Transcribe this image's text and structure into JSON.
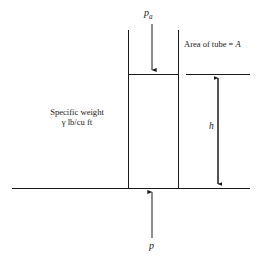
{
  "figure": {
    "background_color": "#ffffff",
    "line_color": "#1a1a1a",
    "width": 276,
    "height": 262
  },
  "labels": {
    "applied_pressure": {
      "symbol": "p",
      "subscript": "a",
      "name": "atmospheric-pressure-label"
    },
    "area_of_tube": {
      "text": "Area of tube = ",
      "symbol": "A",
      "name": "area-of-tube-label"
    },
    "height": {
      "symbol": "h",
      "name": "height-label"
    },
    "specific_weight": {
      "line1": "Specific weight",
      "line2": "γ lb/cu ft",
      "name": "specific-weight-label"
    },
    "bottom_pressure": {
      "symbol": "p",
      "name": "bottom-pressure-label"
    }
  },
  "geometry": {
    "tube_left_x": 128,
    "tube_right_x": 178,
    "tube_top_y": 30,
    "liquid_surface_y": 74,
    "baseline_y": 188,
    "baseline_left_x": 12,
    "baseline_right_x": 250,
    "surface_line_right_start_x": 186,
    "surface_line_right_end_x": 250,
    "center_arrow_x": 152,
    "pa_arrow_top_y": 24,
    "pa_arrow_bottom_y": 73,
    "p_arrow_bottom_y": 238,
    "p_arrow_top_y": 189,
    "h_arrow_x": 218,
    "h_arrow_top_y": 75,
    "h_arrow_bottom_y": 187
  }
}
